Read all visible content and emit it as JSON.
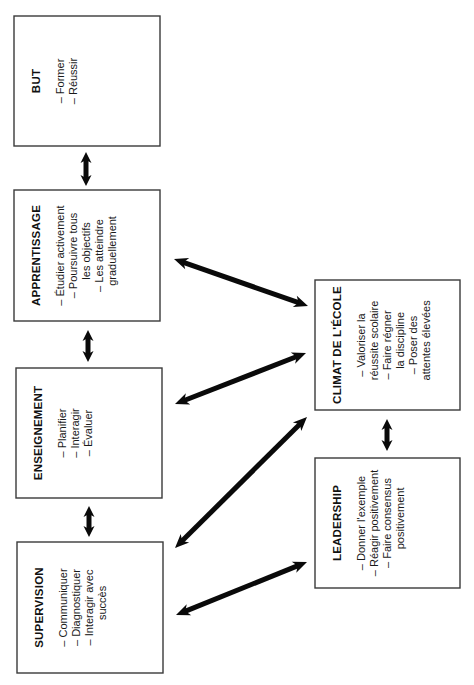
{
  "diagram": {
    "orientation": "rotated-90-ccw",
    "colors": {
      "box_border": "#3a3a3a",
      "box_fill": "#ffffff",
      "arrow": "#0a0a0a",
      "text": "#111111",
      "background": "#ffffff"
    },
    "nodes": [
      {
        "id": "but",
        "title": "BUT",
        "items": [
          "– Former",
          "– Réussir"
        ],
        "x": 14,
        "y": 16,
        "w": 146,
        "h": 130
      },
      {
        "id": "apprentissage",
        "title": "APPRENTISSAGE",
        "items": [
          "– Étudier activement",
          "– Poursuivre tous",
          "   les objectifs",
          "– Les atteindre",
          "   graduellement"
        ],
        "x": 14,
        "y": 190,
        "w": 146,
        "h": 131
      },
      {
        "id": "enseignement",
        "title": "ENSEIGNEMENT",
        "items": [
          "– Planifier",
          "– Interagir",
          "– Évaluer"
        ],
        "x": 16,
        "y": 368,
        "w": 146,
        "h": 130
      },
      {
        "id": "supervision",
        "title": "SUPERVISION",
        "items": [
          "– Communiquer",
          "– Diagnostiquer",
          "– Interagir avec",
          "   succès"
        ],
        "x": 17,
        "y": 542,
        "w": 146,
        "h": 131
      },
      {
        "id": "climat",
        "title": "CLIMAT DE L'ÉCOLE",
        "items": [
          "– Valoriser la",
          "   réussite scolaire",
          "– Faire régner",
          "   la discipline",
          "– Poser des",
          "   attentes élevées"
        ],
        "x": 315,
        "y": 280,
        "w": 145,
        "h": 130
      },
      {
        "id": "leadership",
        "title": "LEADERSHIP",
        "items": [
          "– Donner l'exemple",
          "– Réagir positivement",
          "– Faire consensus",
          "   positivement"
        ],
        "x": 315,
        "y": 458,
        "w": 145,
        "h": 130
      }
    ],
    "connectors": [
      {
        "id": "but-apprentissage",
        "from": "but",
        "to": "apprentissage",
        "kind": "double-arrow-vertical",
        "x1": 86,
        "y1": 152,
        "x2": 86,
        "y2": 186
      },
      {
        "id": "apprentissage-enseignement",
        "from": "apprentissage",
        "to": "enseignement",
        "kind": "double-arrow-vertical",
        "x1": 88,
        "y1": 330,
        "x2": 88,
        "y2": 362
      },
      {
        "id": "enseignement-supervision",
        "from": "enseignement",
        "to": "supervision",
        "kind": "double-arrow-vertical",
        "x1": 89,
        "y1": 506,
        "x2": 89,
        "y2": 537
      },
      {
        "id": "climat-leadership",
        "from": "climat",
        "to": "leadership",
        "kind": "double-arrow-vertical",
        "x1": 387,
        "y1": 419,
        "x2": 387,
        "y2": 451
      },
      {
        "id": "apprentissage-climat",
        "from": "apprentissage",
        "to": "climat",
        "kind": "double-arrow-diagonal",
        "x1": 174,
        "y1": 259,
        "x2": 308,
        "y2": 306
      },
      {
        "id": "enseignement-climat",
        "from": "enseignement",
        "to": "climat",
        "kind": "double-arrow-diagonal",
        "x1": 175,
        "y1": 404,
        "x2": 306,
        "y2": 353
      },
      {
        "id": "supervision-climat",
        "from": "supervision",
        "to": "climat",
        "kind": "double-arrow-diagonal",
        "x1": 175,
        "y1": 548,
        "x2": 307,
        "y2": 417
      },
      {
        "id": "supervision-leadership",
        "from": "supervision",
        "to": "leadership",
        "kind": "double-arrow-diagonal",
        "x1": 176,
        "y1": 615,
        "x2": 307,
        "y2": 562
      }
    ]
  }
}
